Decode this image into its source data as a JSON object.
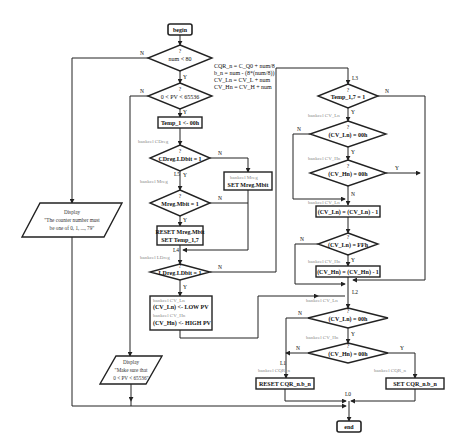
{
  "flowchart": {
    "begin": "begin",
    "end": "end",
    "decision_marker": "?",
    "yes": "Y",
    "no": "N",
    "d_num": "num < 80",
    "d_pv": "0 < PV < 65536",
    "note": [
      "CQR_n = C_Q0 + num/8",
      "b_n = num - (8*(num/8))",
      "CV_Ln = CV_L + num",
      "CV_Hn = CV_H + num"
    ],
    "p_temp": "Temp_1 <- 00h",
    "g_cdreg": "bankcel CDreg",
    "d_cdreg": "CDreg.LDbit = 1",
    "l5": "L5",
    "g_mreg": "bankcel Mreg",
    "p_setm_label": "bankcel Mreg",
    "p_setm": "SET Mreg.Mbit",
    "d_mreg": "Mreg.Mbit = 1",
    "p_reset1": "RESET Mreg.Mbit",
    "p_reset2": "SET Temp_1,7",
    "l4": "L4",
    "g_ldreg": "bankcel LDreg",
    "d_ldreg": "LDreg.LDbit = 1",
    "p_low_g1": "bankcel CV_Ln",
    "p_low": "(CV_Ln) <- LOW PV",
    "p_low_g2": "bankcel CV_Hn",
    "p_high": "(CV_Hn) <- HIGH PV",
    "disp1_title": "Display",
    "disp1_l1": "\"The counter number must",
    "disp1_l2": "be one of 0, 1, ..., 79\"",
    "disp2_title": "Display",
    "disp2_l1": "\"Make sure that",
    "disp2_l2": "0 < PV < 65536\"",
    "l3": "L3",
    "d_temp": "Temp_1,7 = 1",
    "g_cvln1": "bankcel CV_Ln",
    "d_cvln0": "(CV_Ln) = 00h",
    "g_cvhn1": "bankcel CV_Hn",
    "d_cvhn0": "(CV_Hn) = 00h",
    "g_cvln2": "bankcel CV_Ln",
    "p_dec_ln": "(CV_Ln) = (CV_Ln) - 1",
    "d_cvlnff": "(CV_Ln) = FFh",
    "g_cvhn2": "bankcel CV_Hn",
    "p_dec_hn": "(CV_Hn) = (CV_Hn) - 1",
    "l2": "L2",
    "g_cvln3": "bankcel CV_Ln",
    "d_cvln0b": "(CV_Ln) = 00h",
    "g_cvhn3": "bankcel CV_Hn",
    "d_cvhn0b": "(CV_Hn) = 00h",
    "l1": "L1",
    "g_cqr1": "bankcel CQR_n",
    "p_reset_cqr": "RESET CQR_n.b_n",
    "g_cqr2": "bankcel CQR_n",
    "p_set_cqr": "SET CQR_n.b_n",
    "l0": "L0"
  }
}
